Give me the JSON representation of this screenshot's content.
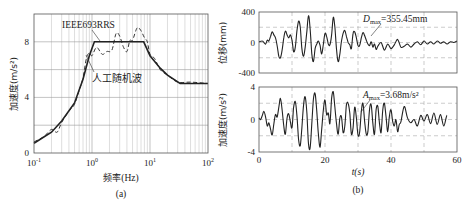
{
  "chart_data": [
    {
      "id": "a",
      "type": "line",
      "panel_label": "(a)",
      "title": "",
      "xlabel": "频率(Hz)",
      "ylabel": "加速度(m/s²)",
      "xscale": "log",
      "xlim": [
        0.1,
        100
      ],
      "ylim": [
        0,
        10
      ],
      "xticks": [
        "10⁻¹",
        "10⁰",
        "10¹",
        "10²"
      ],
      "yticks": [
        "0",
        "4",
        "8"
      ],
      "grid": true,
      "series": [
        {
          "name": "IEEE693RRS",
          "style": "solid",
          "x": [
            0.1,
            0.2,
            0.3,
            0.5,
            0.7,
            0.9,
            1.1,
            7.8,
            10,
            15,
            20,
            33,
            100
          ],
          "y": [
            0.7,
            1.5,
            2.3,
            3.6,
            5.3,
            7.0,
            8.0,
            8.0,
            7.0,
            6.1,
            5.6,
            5.0,
            5.0
          ]
        },
        {
          "name": "人工随机波",
          "style": "dashed",
          "x": [
            0.1,
            0.15,
            0.2,
            0.25,
            0.3,
            0.4,
            0.5,
            0.6,
            0.7,
            0.8,
            0.9,
            1.0,
            1.2,
            1.5,
            1.8,
            2.2,
            2.6,
            3.0,
            3.5,
            4.0,
            4.5,
            5.0,
            6.0,
            7.0,
            8.0,
            9.0,
            10,
            12,
            15,
            20,
            30,
            50,
            100
          ],
          "y": [
            0.8,
            1.2,
            1.7,
            1.5,
            2.2,
            3.0,
            3.5,
            4.5,
            5.4,
            6.8,
            7.2,
            7.0,
            7.6,
            7.1,
            7.3,
            7.4,
            8.6,
            8.4,
            7.6,
            7.3,
            8.1,
            8.1,
            9.0,
            8.8,
            8.3,
            8.0,
            7.1,
            6.8,
            6.0,
            5.6,
            5.1,
            5.1,
            5.0
          ]
        }
      ],
      "annotations": [
        "IEEE693RRS",
        "人工随机波"
      ]
    },
    {
      "id": "b-top",
      "type": "line",
      "panel_label": "(b)",
      "xlabel": "",
      "ylabel": "位移(mm)",
      "xlim": [
        0,
        60
      ],
      "ylim": [
        -400,
        400
      ],
      "yticks": [
        "400",
        "0",
        "-400"
      ],
      "grid": "dashed",
      "annotation": {
        "text_main": "D",
        "text_sub": "max",
        "text_rest": "=355.45mm"
      },
      "series": [
        {
          "name": "displacement",
          "t": [
            0,
            1,
            1.5,
            2,
            2.5,
            3,
            3.5,
            4,
            4.5,
            5,
            5.5,
            6,
            6.5,
            7,
            7.5,
            8,
            8.5,
            9,
            9.5,
            10,
            10.5,
            11,
            11.5,
            12,
            12.5,
            13,
            13.5,
            14,
            14.5,
            15,
            15.5,
            16,
            16.5,
            17,
            17.5,
            18,
            18.5,
            19,
            19.5,
            20,
            20.5,
            21,
            21.5,
            22,
            22.5,
            23,
            23.5,
            24,
            24.5,
            25,
            25.5,
            26,
            26.5,
            27,
            27.5,
            28,
            28.5,
            29,
            29.5,
            30,
            30.5,
            31,
            31.5,
            32,
            32.5,
            33,
            33.5,
            34,
            34.5,
            35,
            35.5,
            36,
            37,
            38,
            39,
            40,
            41,
            42,
            43,
            44,
            45,
            46,
            47,
            48,
            49,
            50,
            51,
            52,
            53,
            54,
            55,
            56,
            57,
            58,
            59,
            60
          ],
          "y": [
            10,
            20,
            0,
            -20,
            30,
            20,
            80,
            140,
            100,
            60,
            -40,
            -180,
            -200,
            -100,
            60,
            150,
            100,
            60,
            100,
            30,
            -120,
            -60,
            150,
            280,
            200,
            -80,
            -180,
            -60,
            150,
            350,
            180,
            -150,
            -250,
            -80,
            -20,
            20,
            -40,
            -150,
            -20,
            120,
            80,
            -20,
            -30,
            100,
            330,
            200,
            -100,
            -250,
            -150,
            20,
            120,
            160,
            80,
            0,
            -30,
            -80,
            120,
            140,
            60,
            -40,
            -40,
            60,
            130,
            90,
            30,
            -20,
            -40,
            10,
            -60,
            -20,
            -90,
            -50,
            0,
            -100,
            -20,
            -80,
            -30,
            40,
            -60,
            -50,
            -20,
            -60,
            -20,
            10,
            -30,
            20,
            -20,
            10,
            -20,
            20,
            -10,
            10,
            -20,
            10,
            0,
            20,
            -10,
            20
          ]
        }
      ]
    },
    {
      "id": "b-bottom",
      "type": "line",
      "xlabel": "t(s)",
      "ylabel": "加速度(m/s²)",
      "xlim": [
        0,
        60
      ],
      "ylim": [
        -4,
        4
      ],
      "xticks": [
        "0",
        "20",
        "40",
        "60"
      ],
      "yticks": [
        "4",
        "0",
        "-4"
      ],
      "grid": "dashed",
      "annotation": {
        "text_main": "A",
        "text_sub": "max",
        "text_rest": "=3.68m/s²"
      },
      "series": [
        {
          "name": "acceleration",
          "t": [
            0,
            0.5,
            1,
            1.5,
            2,
            2.5,
            3,
            3.5,
            4,
            4.5,
            5,
            5.5,
            6,
            6.5,
            7,
            7.5,
            8,
            8.5,
            9,
            9.5,
            10,
            10.5,
            11,
            11.5,
            12,
            12.5,
            13,
            13.5,
            14,
            14.5,
            15,
            15.5,
            16,
            16.5,
            17,
            17.5,
            18,
            18.5,
            19,
            19.5,
            20,
            20.5,
            21,
            21.5,
            22,
            22.5,
            23,
            23.5,
            24,
            24.5,
            25,
            25.5,
            26,
            26.5,
            27,
            27.5,
            28,
            28.5,
            29,
            29.5,
            30,
            30.5,
            31,
            31.5,
            32,
            32.5,
            33,
            33.5,
            34,
            34.5,
            35,
            35.5,
            36,
            36.5,
            37,
            37.5,
            38,
            38.5,
            39,
            39.5,
            40,
            40.5,
            41,
            41.5,
            42,
            42.5,
            43,
            44,
            45,
            46,
            47,
            48,
            49,
            50,
            51,
            52,
            53,
            54,
            55,
            56,
            57,
            58,
            59,
            60
          ],
          "y": [
            0.2,
            0,
            0.5,
            1,
            0.3,
            -0.8,
            -0.4,
            -1.2,
            -1.9,
            -0.5,
            0.6,
            0.3,
            1.5,
            2.6,
            1.2,
            -0.8,
            -1.8,
            0.2,
            0.7,
            -0.3,
            -1,
            1.5,
            2.2,
            0.5,
            -2.5,
            -3.2,
            -1,
            1.8,
            2.8,
            0.8,
            -3,
            -3.5,
            -0.5,
            2.5,
            3.2,
            1,
            -1.8,
            -3.4,
            -1.2,
            1.2,
            2.4,
            0.6,
            0.8,
            -0.5,
            2.6,
            3.4,
            1.5,
            -0.6,
            -1.8,
            0.2,
            0.3,
            -1.6,
            -0.8,
            1.8,
            2,
            0.8,
            -1.8,
            -1,
            1.5,
            0.2,
            -1.9,
            -1.6,
            1,
            2,
            -0.2,
            -1.8,
            -1.5,
            1.3,
            1.8,
            -0.5,
            -1.8,
            1.2,
            1.6,
            -0.4,
            -1.6,
            1.2,
            2,
            0.3,
            -1.5,
            0.4,
            1.2,
            -0.2,
            -0.8,
            0,
            -1.5,
            -0.6,
            -0.3,
            1.6,
            0.2,
            -0.4,
            0,
            -0.8,
            0.5,
            -0.2,
            0.6,
            -0.5,
            0.8,
            -0.6,
            0.6,
            -0.8,
            0.5,
            -0.6
          ]
        }
      ]
    }
  ],
  "panels": {
    "a": {
      "label": "(a)",
      "xlabel_cn": "频率",
      "xlabel_unit": "(Hz)",
      "ylabel": "加速度(m/s²)"
    },
    "b": {
      "label": "(b)",
      "xlabel": "t(s)",
      "ylabel_top": "位移(mm)",
      "ylabel_bottom": "加速度(m/s²)"
    }
  }
}
